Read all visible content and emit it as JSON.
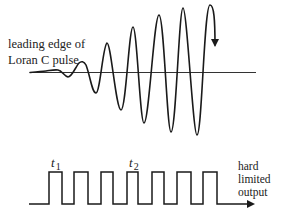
{
  "labels": {
    "pulse_line1": "leading edge of",
    "pulse_line2": "Loran C  pulse",
    "t1": "t",
    "t1_sub": "1",
    "t2": "t",
    "t2_sub": "2",
    "output_line1": "hard",
    "output_line2": "limited",
    "output_line3": "output"
  },
  "waveform": {
    "description": "Loran C pulse leading edge, growing-amplitude sinusoid",
    "cycles": 6,
    "relative_peak_amplitudes": [
      0.15,
      0.45,
      0.65,
      0.8,
      0.9,
      0.95
    ],
    "relative_trough_amplitudes": [
      0.05,
      0.3,
      0.55,
      0.75,
      0.88,
      0.92
    ]
  },
  "square_wave": {
    "pulses": 7,
    "markers": [
      "t1",
      "t2"
    ],
    "t1_pulse_index": 1,
    "t2_pulse_index": 4
  },
  "colors": {
    "stroke": "#1a1a1a",
    "text": "#222222",
    "background": "#ffffff"
  }
}
